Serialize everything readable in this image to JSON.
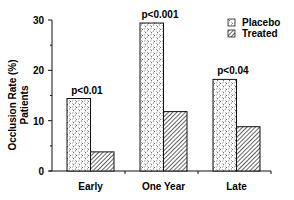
{
  "chart_data": {
    "type": "bar",
    "title": "",
    "xlabel": "",
    "ylabel": "Occlusion Rate (%)",
    "ylabel_line2": "Patients",
    "ylim": [
      0,
      30
    ],
    "yticks": [
      0,
      10,
      20,
      30
    ],
    "grid": false,
    "legend_position": "top-right",
    "categories": [
      "Early",
      "One Year",
      "Late"
    ],
    "series": [
      {
        "name": "Placebo",
        "pattern": "dotted-crosshatch",
        "values": [
          14.4,
          29.4,
          18.2
        ]
      },
      {
        "name": "Treated",
        "pattern": "diagonal-hatch",
        "values": [
          3.8,
          11.8,
          8.8
        ]
      }
    ],
    "annotations": [
      {
        "category": "Early",
        "text": "p<0.01"
      },
      {
        "category": "One Year",
        "text": "p<0.001"
      },
      {
        "category": "Late",
        "text": "p<0.04"
      }
    ]
  }
}
